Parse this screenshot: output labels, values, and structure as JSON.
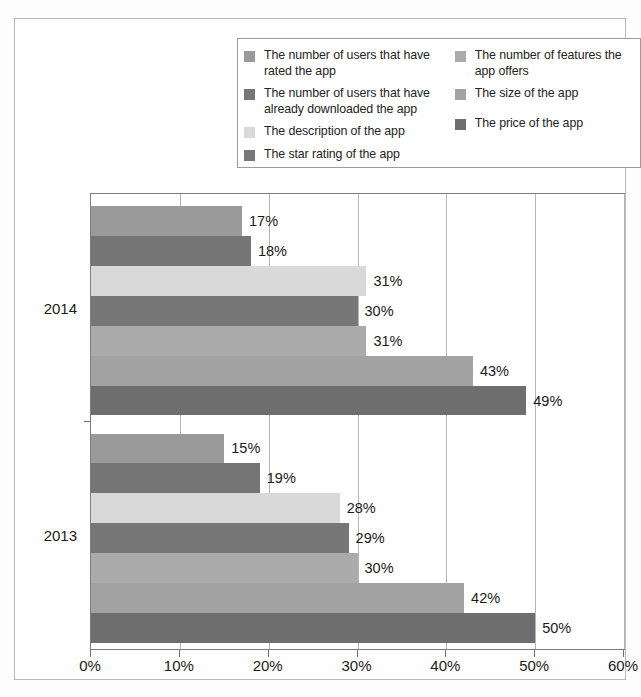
{
  "chart_data": {
    "type": "bar",
    "orientation": "horizontal",
    "title": "",
    "subtitle": "",
    "xlabel": "",
    "ylabel": "",
    "categories": [
      "2014",
      "2013"
    ],
    "xlim": [
      0,
      60
    ],
    "xticks": [
      "0%",
      "10%",
      "20%",
      "30%",
      "40%",
      "50%",
      "60%"
    ],
    "xtick_values": [
      0,
      10,
      20,
      30,
      40,
      50,
      60
    ],
    "grid": true,
    "legend_position": "top",
    "value_labels": true,
    "value_label_suffix": "%",
    "series": [
      {
        "name": "The number of users that have rated the app",
        "color": "#9a9a9a",
        "values": [
          17,
          15
        ],
        "labels": [
          "17%",
          "15%"
        ]
      },
      {
        "name": "The number of users that have already downloaded the app",
        "color": "#757575",
        "values": [
          18,
          19
        ],
        "labels": [
          "18%",
          "19%"
        ]
      },
      {
        "name": "The description of the app",
        "color": "#d9d9d9",
        "values": [
          31,
          28
        ],
        "labels": [
          "31%",
          "28%"
        ]
      },
      {
        "name": "The star rating of the app",
        "color": "#777777",
        "values": [
          30,
          29
        ],
        "labels": [
          "30%",
          "29%"
        ]
      },
      {
        "name": "The number of features the app offers",
        "color": "#ababab",
        "values": [
          31,
          30
        ],
        "labels": [
          "31%",
          "30%"
        ]
      },
      {
        "name": "The size of the app",
        "color": "#a2a2a2",
        "values": [
          43,
          42
        ],
        "labels": [
          "43%",
          "42%"
        ]
      },
      {
        "name": "The price of the app",
        "color": "#6e6e6e",
        "values": [
          49,
          50
        ],
        "labels": [
          "49%",
          "50%"
        ]
      }
    ]
  },
  "legend": {
    "left_column": [
      {
        "label": "The number of users that have rated the app",
        "color": "#9a9a9a"
      },
      {
        "label": "The number of users that have already downloaded the app",
        "color": "#757575"
      },
      {
        "label": "The description of the app",
        "color": "#d9d9d9"
      },
      {
        "label": "The star rating of the app",
        "color": "#777777"
      }
    ],
    "right_column": [
      {
        "label": "The number of features the app offers",
        "color": "#ababab"
      },
      {
        "label": "The size of the app",
        "color": "#a2a2a2"
      },
      {
        "label": "The price of the app",
        "color": "#6e6e6e"
      }
    ]
  },
  "axis": {
    "y_categories": [
      "2014",
      "2013"
    ],
    "x_ticks": [
      "0%",
      "10%",
      "20%",
      "30%",
      "40%",
      "50%",
      "60%"
    ]
  }
}
